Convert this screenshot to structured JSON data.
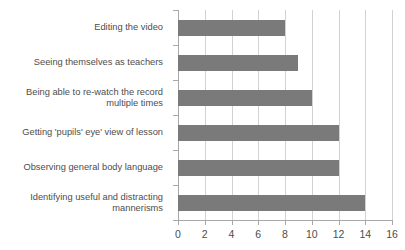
{
  "chart_data": {
    "type": "bar",
    "orientation": "horizontal",
    "title": "",
    "subtitle": "",
    "xlabel": "",
    "ylabel": "",
    "xlim": [
      0,
      16
    ],
    "xticks": [
      0,
      2,
      4,
      6,
      8,
      10,
      12,
      14,
      16
    ],
    "grid": "vertical",
    "legend": "none",
    "bar_color": "#7a7a7a",
    "gridline_color": "#d2d2d2",
    "axis_color": "#a8a8a8",
    "text_color": "#4d4d4d",
    "categories": [
      "Editing the video",
      "Seeing themselves as teachers",
      "Being able to re-watch the record\nmultiple times",
      "Getting 'pupils' eye' view of lesson",
      "Observing general body language",
      "Identifying useful and distracting\nmannerisms"
    ],
    "values": [
      8,
      9,
      10,
      12,
      12,
      14
    ],
    "series": [
      {
        "name": "",
        "values": [
          8,
          9,
          10,
          12,
          12,
          14
        ]
      }
    ]
  }
}
